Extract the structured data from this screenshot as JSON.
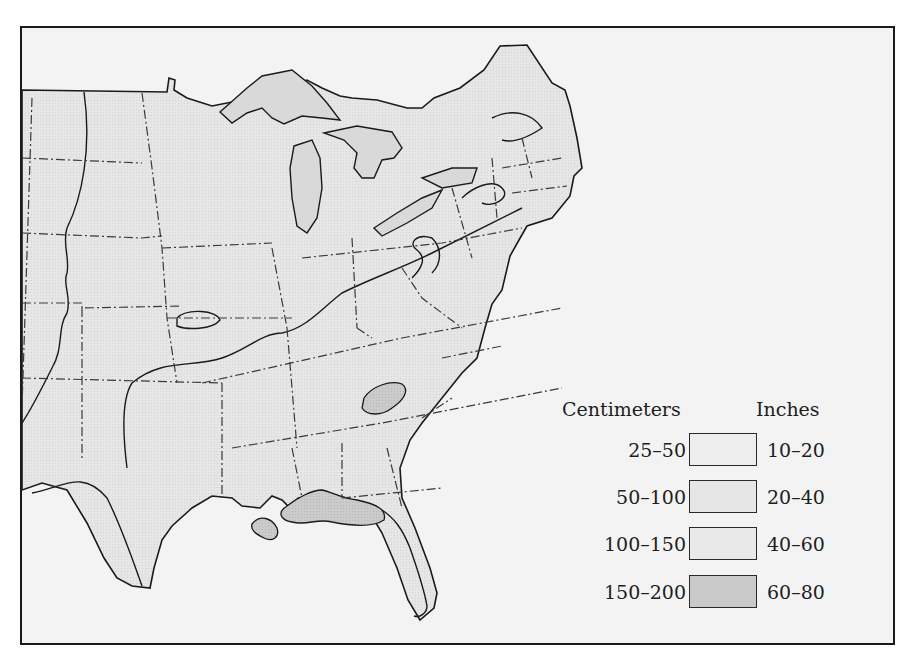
{
  "map": {
    "title": "",
    "region": "Eastern United States",
    "colors": {
      "ocean": "#f3f3f3",
      "land": "#e6e6e6",
      "zone_25_50": "#ededed",
      "zone_50_100": "#e6e6e6",
      "zone_100_150": "#e9e9e9",
      "zone_150_200": "#c9c9c9",
      "lakes": "#dcdcdc",
      "outline": "#1a1a1a",
      "state_border": "#3a3a3a"
    }
  },
  "legend": {
    "header_left": "Centimeters",
    "header_right": "Inches",
    "items": [
      {
        "cm": "25–50",
        "inches": "10–20",
        "color": "#ededed"
      },
      {
        "cm": "50–100",
        "inches": "20–40",
        "color": "#e6e6e6"
      },
      {
        "cm": "100–150",
        "inches": "40–60",
        "color": "#e9e9e9"
      },
      {
        "cm": "150–200",
        "inches": "60–80",
        "color": "#c9c9c9"
      }
    ]
  }
}
